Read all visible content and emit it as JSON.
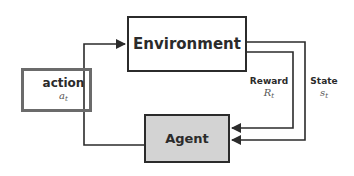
{
  "diagram": {
    "nodes": {
      "environment": {
        "label": "Environment"
      },
      "agent": {
        "label": "Agent"
      },
      "action": {
        "label": "action",
        "symbol": "a",
        "subscript": "t"
      }
    },
    "edges": {
      "reward": {
        "label": "Reward",
        "symbol": "R",
        "subscript": "t"
      },
      "state": {
        "label": "State",
        "symbol": "s",
        "subscript": "t"
      }
    },
    "colors": {
      "line": "#2b2b2b",
      "action_border": "#6b6b6b",
      "agent_fill": "#d3d3d3",
      "background": "#ffffff"
    }
  }
}
